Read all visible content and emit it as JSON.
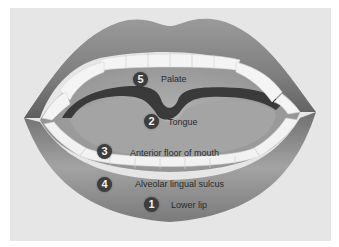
{
  "diagram": {
    "type": "anatomical-illustration",
    "colors": {
      "background_panel": "#e6e6e6",
      "lip": "#8a8a8a",
      "lip_shadow": "#5e5e5e",
      "teeth": "#f4f4f4",
      "palate_tongue": "#a8a8a8",
      "throat_dark": "#3a3a3a",
      "badge": "#3d3d3d",
      "badge_text": "#f2f2f2",
      "label_text": "#2a2a2a"
    },
    "callouts": [
      {
        "number": "5",
        "label": "Palate"
      },
      {
        "number": "2",
        "label": "Tongue"
      },
      {
        "number": "3",
        "label": "Anterior floor of mouth"
      },
      {
        "number": "4",
        "label": "Alveolar lingual sulcus"
      },
      {
        "number": "1",
        "label": "Lower lip"
      }
    ]
  }
}
